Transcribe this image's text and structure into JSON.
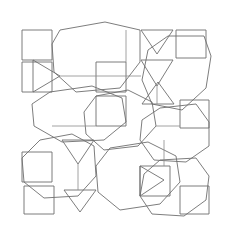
{
  "figure": {
    "width": 229,
    "height": 237,
    "background_color": "#ffffff",
    "stroke_color": "#6e6e6e",
    "stroke_color_light": "#8a8a8a",
    "stroke_width": 0.9
  },
  "chart_data": {
    "type": "diagram",
    "shape_count": 25,
    "octagon_count": 8,
    "triangle_count": 7,
    "square_count": 10,
    "bounds": {
      "x_min": 20,
      "y_min": 22,
      "x_max": 211,
      "y_max": 218
    }
  },
  "shapes": {
    "octagons": [
      {
        "name": "octagon-top-left",
        "points": "60,30 105,22 140,30 140,62 120,88 76,92 54,72 52,44"
      },
      {
        "name": "octagon-top-right",
        "points": "168,36 204,36 211,56 206,88 182,110 152,104 142,80 148,50"
      },
      {
        "name": "octagon-upper-mid-left",
        "points": "50,92 92,86 122,98 126,122 104,140 62,142 34,126 32,104"
      },
      {
        "name": "octagon-mid-right",
        "points": "160,108 196,104 209,122 209,146 186,162 154,160 140,140 142,120"
      },
      {
        "name": "octagon-lower-left",
        "points": "40,140 72,134 94,146 96,176 78,196 44,198 24,182 22,158"
      },
      {
        "name": "octagon-lower-mid",
        "points": "110,148 148,142 176,156 180,182 160,204 120,210 98,192 96,166"
      },
      {
        "name": "octagon-lower-right",
        "points": "160,160 196,158 209,176 206,200 184,216 152,214 140,196 144,174"
      },
      {
        "name": "octagon-center",
        "points": "96,96 128,90 152,102 156,126 138,146 104,150 86,134 84,112"
      }
    ],
    "triangles": [
      {
        "name": "triangle-left-upper",
        "points": "33,60 33,92 60,76",
        "direction": "right"
      },
      {
        "name": "triangle-top-mid",
        "points": "141,60 173,60 157,86",
        "direction": "down"
      },
      {
        "name": "triangle-upper-right",
        "points": "141,30 173,30 157,54",
        "direction": "down"
      },
      {
        "name": "triangle-center-left",
        "points": "62,140 94,140 78,164",
        "direction": "down"
      },
      {
        "name": "triangle-mid-right",
        "points": "142,104 174,104 158,82",
        "direction": "up"
      },
      {
        "name": "triangle-lower-left",
        "points": "64,190 96,190 80,212",
        "direction": "down"
      },
      {
        "name": "triangle-lower-right",
        "points": "140,166 140,196 164,180",
        "direction": "right"
      }
    ],
    "squares": [
      {
        "name": "square-corner-top-left",
        "points": "22,30 52,30 52,60 22,60"
      },
      {
        "name": "square-top-right-edge",
        "points": "176,30 206,30 206,58 176,58"
      },
      {
        "name": "square-center-junction",
        "points": "96,96 126,96 126,126 96,126"
      },
      {
        "name": "square-left-lower",
        "points": "22,152 52,152 52,182 22,182"
      },
      {
        "name": "square-bottom-left-corner",
        "points": "24,186 54,186 54,214 24,214"
      },
      {
        "name": "square-right-mid",
        "points": "180,100 209,100 209,128 180,128"
      },
      {
        "name": "square-bottom-right",
        "points": "180,186 209,186 209,214 180,214"
      },
      {
        "name": "square-upper-center",
        "points": "96,62 126,62 126,92 96,92"
      },
      {
        "name": "square-lower-center",
        "points": "140,166 170,166 170,196 140,196"
      },
      {
        "name": "square-left-top",
        "points": "22,62 52,62 52,92 22,92"
      }
    ],
    "connectors": [
      {
        "name": "connector-h-upper-left",
        "points": "60,76 141,76"
      },
      {
        "name": "connector-v-top-mid",
        "points": "126,30 126,62"
      },
      {
        "name": "connector-v-center",
        "points": "157,86 157,104"
      },
      {
        "name": "connector-h-center",
        "points": "52,126 96,126"
      },
      {
        "name": "connector-h-mid-right",
        "points": "156,126 180,126"
      },
      {
        "name": "connector-v-lower-mid",
        "points": "78,164 78,190"
      },
      {
        "name": "connector-v-lower-right",
        "points": "164,140 164,166"
      }
    ]
  }
}
